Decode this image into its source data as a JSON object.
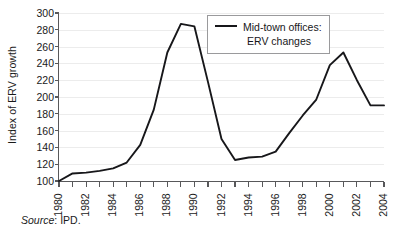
{
  "figure": {
    "background": "#ffffff",
    "line_color": "#17171a",
    "axis_color": "#58585a",
    "grid_color": "#ececec"
  },
  "ylabel": "Index of ERV growth",
  "legend": {
    "line1": "Mid-town offices:",
    "line2": "ERV changes",
    "position": "top-center-right",
    "border_color": "#9a9a9c"
  },
  "source": {
    "label": "Source",
    "separator": ":",
    "value": "IPD."
  },
  "chart_data": {
    "type": "line",
    "title": "",
    "xlabel": "",
    "ylabel": "Index of ERV growth",
    "ylim": [
      100,
      300
    ],
    "xlim": [
      1980,
      2004
    ],
    "yticks": [
      100,
      120,
      140,
      160,
      180,
      200,
      220,
      240,
      260,
      280,
      300
    ],
    "ytick_labels": [
      "100",
      "120",
      "140",
      "160",
      "180",
      "200",
      "220",
      "240",
      "260",
      "280",
      "300"
    ],
    "xticks": [
      1980,
      1981,
      1982,
      1983,
      1984,
      1985,
      1986,
      1987,
      1988,
      1989,
      1990,
      1991,
      1992,
      1993,
      1994,
      1995,
      1996,
      1997,
      1998,
      1999,
      2000,
      2001,
      2002,
      2003,
      2004
    ],
    "xtick_labels": [
      "1980",
      "",
      "1982",
      "",
      "1984",
      "",
      "1986",
      "",
      "1988",
      "",
      "1990",
      "",
      "1992",
      "",
      "1994",
      "",
      "1996",
      "",
      "1998",
      "",
      "2000",
      "",
      "2002",
      "",
      "2004"
    ],
    "grid": "horizontal",
    "legend_position": "upper center",
    "series": [
      {
        "name": "Mid-town offices: ERV changes",
        "color": "#17171a",
        "x": [
          1980,
          1981,
          1982,
          1983,
          1984,
          1985,
          1986,
          1987,
          1988,
          1989,
          1990,
          1991,
          1992,
          1993,
          1994,
          1995,
          1996,
          1997,
          1998,
          1999,
          2000,
          2001,
          2002,
          2003,
          2004
        ],
        "values": [
          100,
          109,
          110,
          112,
          115,
          122,
          143,
          185,
          253,
          287,
          284,
          218,
          150,
          125,
          128,
          129,
          135,
          157,
          178,
          197,
          238,
          253,
          220,
          190,
          190
        ]
      }
    ]
  }
}
